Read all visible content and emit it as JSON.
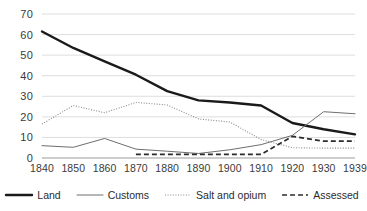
{
  "chart_data": {
    "type": "line",
    "title": "",
    "xlabel": "",
    "ylabel": "",
    "categories": [
      "1840",
      "1850",
      "1860",
      "1870",
      "1880",
      "1890",
      "1900",
      "1910",
      "1920",
      "1930",
      "1939"
    ],
    "x": [
      1840,
      1850,
      1860,
      1870,
      1880,
      1890,
      1900,
      1910,
      1920,
      1930,
      1939
    ],
    "ylim": [
      0,
      70
    ],
    "ytick_step": 10,
    "yticks": [
      0,
      10,
      20,
      30,
      40,
      50,
      60,
      70
    ],
    "grid": "horizontal",
    "legend_position": "bottom",
    "series": [
      {
        "name": "Land",
        "style": "solid-thick",
        "color": "#1a1a1a",
        "values": [
          61.5,
          53.5,
          47.0,
          40.5,
          32.5,
          28.0,
          27.0,
          25.5,
          17.0,
          14.0,
          11.5
        ]
      },
      {
        "name": "Customs",
        "style": "solid-thin",
        "color": "#6e6e6e",
        "values": [
          6.0,
          5.2,
          9.5,
          4.3,
          3.3,
          2.2,
          4.0,
          6.5,
          11.0,
          22.5,
          21.5
        ]
      },
      {
        "name": "Salt and opium",
        "style": "dotted",
        "color": "#8a8a8a",
        "values": [
          16.5,
          25.5,
          22.0,
          27.0,
          25.8,
          19.0,
          17.5,
          9.0,
          5.0,
          4.8,
          4.8
        ]
      },
      {
        "name": "Assessed",
        "style": "dashed",
        "color": "#2b2b2b",
        "values": [
          null,
          null,
          null,
          1.8,
          1.8,
          1.8,
          1.8,
          1.8,
          10.5,
          8.2,
          8.2
        ]
      }
    ]
  },
  "legend": {
    "items": [
      {
        "label": "Land",
        "swatch": "solid-thick-swatch"
      },
      {
        "label": "Customs",
        "swatch": "solid-thin-swatch"
      },
      {
        "label": "Salt and opium",
        "swatch": "dotted-swatch"
      },
      {
        "label": "Assessed",
        "swatch": "dashed-swatch"
      }
    ]
  }
}
